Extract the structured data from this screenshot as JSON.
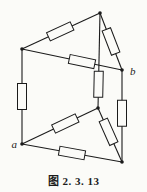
{
  "figure": {
    "caption": "图 2. 3. 13",
    "canvas": {
      "width": 147,
      "height": 192,
      "background": "#fbfbf8",
      "line_color": "#1b1b1b"
    },
    "terminal_labels": [
      {
        "text": "a",
        "x": 17,
        "y": 148,
        "anchor": "end"
      },
      {
        "text": "b",
        "x": 130,
        "y": 75,
        "anchor": "start"
      }
    ],
    "nodes": {
      "top": {
        "x": 100,
        "y": 13
      },
      "top_left": {
        "x": 22,
        "y": 49
      },
      "b": {
        "x": 122,
        "y": 70
      },
      "mid": {
        "x": 98,
        "y": 108
      },
      "a": {
        "x": 22,
        "y": 144
      },
      "bottom_right": {
        "x": 122,
        "y": 162
      }
    },
    "edges": [
      {
        "from": "top_left",
        "to": "top",
        "resistor_at": 0.49
      },
      {
        "from": "top",
        "to": "b",
        "resistor_at": 0.5
      },
      {
        "from": "top_left",
        "to": "b",
        "resistor_at": 0.6
      },
      {
        "from": "top",
        "to": "mid",
        "resistor_at": 0.75
      },
      {
        "from": "top_left",
        "to": "a",
        "resistor_at": 0.5
      },
      {
        "from": "b",
        "to": "bottom_right",
        "resistor_at": 0.47
      },
      {
        "from": "a",
        "to": "mid",
        "resistor_at": 0.57
      },
      {
        "from": "mid",
        "to": "bottom_right",
        "resistor_at": 0.44
      },
      {
        "from": "a",
        "to": "bottom_right",
        "resistor_at": 0.5
      }
    ],
    "resistor": {
      "length": 26,
      "width": 9
    },
    "node_radius": 1.8,
    "wire_width": 1.1
  }
}
